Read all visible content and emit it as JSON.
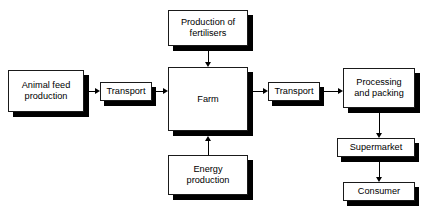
{
  "diagram": {
    "background_color": "#ffffff",
    "line_color": "#000000",
    "box_fill_color": "#ffffff",
    "box_border_color": "#1a1a1a",
    "shadow_color": "#000000",
    "nodes": [
      {
        "id": "animal_feed",
        "label": "Animal feed\nproduction"
      },
      {
        "id": "transport_1",
        "label": "Transport"
      },
      {
        "id": "fertilisers",
        "label": "Production of\nfertilisers"
      },
      {
        "id": "farm",
        "label": "Farm"
      },
      {
        "id": "energy",
        "label": "Energy\nproduction"
      },
      {
        "id": "transport_2",
        "label": "Transport"
      },
      {
        "id": "processing",
        "label": "Processing\nand packing"
      },
      {
        "id": "supermarket",
        "label": "Supermarket"
      },
      {
        "id": "consumer",
        "label": "Consumer"
      }
    ],
    "edges": [
      {
        "from": "animal_feed",
        "to": "transport_1",
        "direction": "right"
      },
      {
        "from": "transport_1",
        "to": "farm",
        "direction": "right"
      },
      {
        "from": "fertilisers",
        "to": "farm",
        "direction": "down"
      },
      {
        "from": "energy",
        "to": "farm",
        "direction": "up"
      },
      {
        "from": "farm",
        "to": "transport_2",
        "direction": "right"
      },
      {
        "from": "transport_2",
        "to": "processing",
        "direction": "right"
      },
      {
        "from": "processing",
        "to": "supermarket",
        "direction": "down"
      },
      {
        "from": "supermarket",
        "to": "consumer",
        "direction": "down"
      }
    ]
  }
}
